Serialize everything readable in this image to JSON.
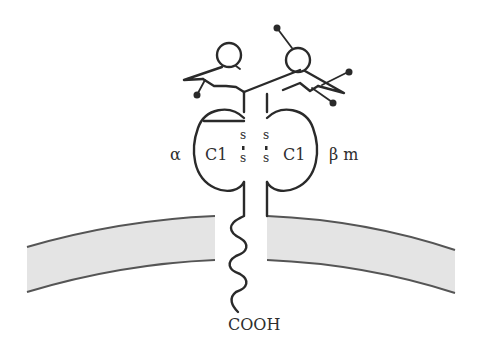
{
  "diagram": {
    "type": "MHC class II-like membrane protein schematic",
    "labels": {
      "alpha": "α",
      "domain_left": "C1",
      "domain_right": "C1",
      "beta_m": "β m",
      "terminus": "COOH",
      "disulfide_s": "s"
    },
    "colors": {
      "stroke": "#2a2a2a",
      "membrane_fill": "#e4e4e4",
      "membrane_edge": "#555555",
      "background": "#ffffff"
    }
  }
}
